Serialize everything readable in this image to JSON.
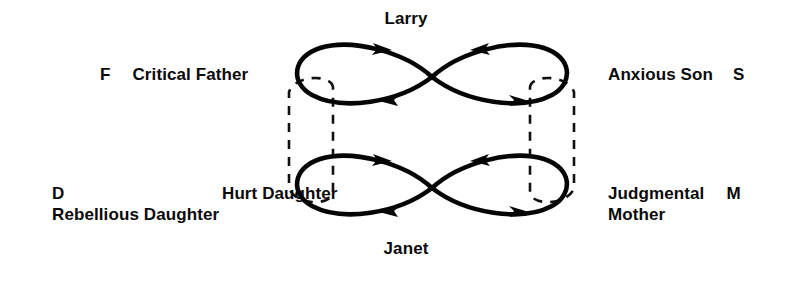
{
  "diagram": {
    "type": "relationship-transaction-diagram",
    "background_color": "#ffffff",
    "ink_color": "#050505",
    "persons": {
      "top": "Larry",
      "bottom": "Janet"
    },
    "roles": {
      "top_left": {
        "ego_state_letter": "F",
        "role_label": "Critical Father"
      },
      "top_right": {
        "ego_state_letter": "S",
        "role_label": "Anxious Son"
      },
      "bottom_left": {
        "ego_state_letter": "D",
        "role_label_line1": "Hurt Daughter",
        "role_label_line2": "Rebellious Daughter"
      },
      "bottom_right": {
        "ego_state_letter": "M",
        "role_label_line1": "Judgmental",
        "role_label_line2": "Mother"
      }
    },
    "figures": [
      {
        "name": "top-figure-eight",
        "person": "Larry",
        "left_ego_state": "F",
        "right_ego_state": "S",
        "arrow_count": 4,
        "arrow_directions": [
          "right",
          "left",
          "left",
          "right"
        ]
      },
      {
        "name": "bottom-figure-eight",
        "person": "Janet",
        "left_ego_state": "D",
        "right_ego_state": "M",
        "arrow_count": 4,
        "arrow_directions": [
          "right",
          "left",
          "left",
          "right"
        ]
      }
    ],
    "connectors": [
      {
        "name": "left-dashed-connector",
        "style": "dashed",
        "connects": [
          "F",
          "D"
        ]
      },
      {
        "name": "right-dashed-connector",
        "style": "dashed",
        "connects": [
          "S",
          "M"
        ]
      }
    ]
  }
}
